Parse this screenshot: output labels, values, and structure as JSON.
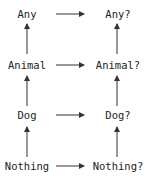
{
  "diagram": {
    "left_column": [
      "Any",
      "Animal",
      "Dog",
      "Nothing"
    ],
    "right_column": [
      "Any?",
      "Animal?",
      "Dog?",
      "Nothing?"
    ],
    "edges_horizontal": [
      [
        "Any",
        "Any?"
      ],
      [
        "Animal",
        "Animal?"
      ],
      [
        "Dog",
        "Dog?"
      ],
      [
        "Nothing",
        "Nothing?"
      ]
    ],
    "edges_vertical": [
      [
        "Animal",
        "Any"
      ],
      [
        "Dog",
        "Animal"
      ],
      [
        "Nothing",
        "Dog"
      ],
      [
        "Animal?",
        "Any?"
      ],
      [
        "Dog?",
        "Animal?"
      ],
      [
        "Nothing?",
        "Dog?"
      ]
    ],
    "colors": {
      "text": "#222222",
      "arrow": "#333333",
      "background": "#ffffff"
    }
  }
}
